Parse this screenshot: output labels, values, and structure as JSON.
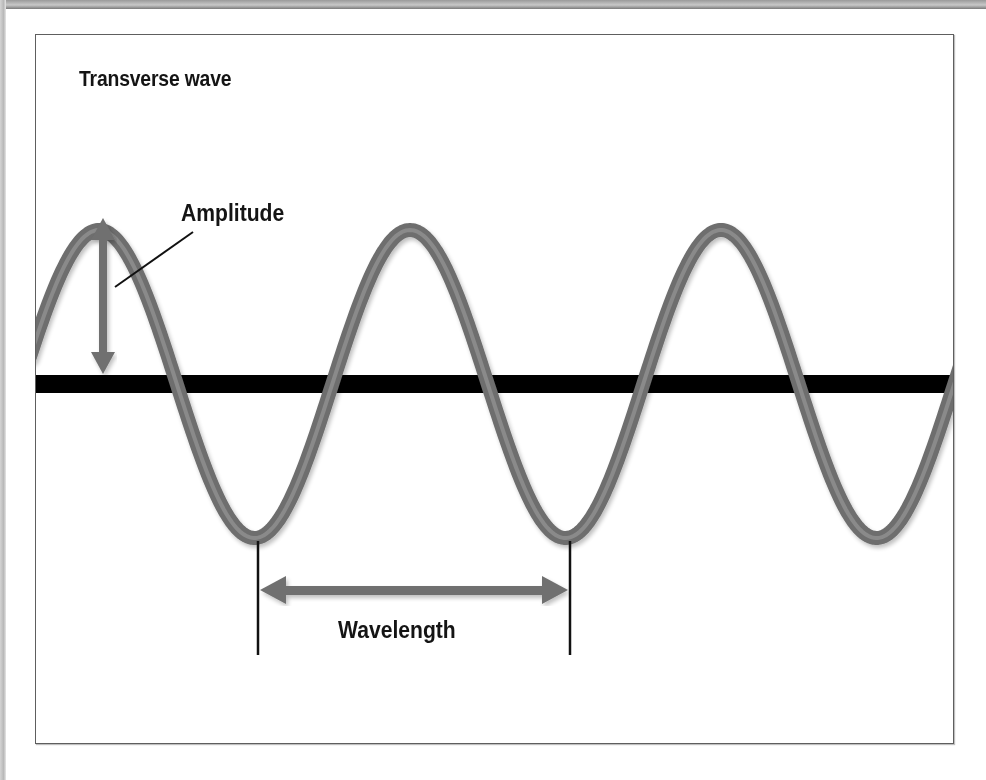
{
  "diagram": {
    "title": "Transverse wave",
    "labels": {
      "amplitude": "Amplitude",
      "wavelength": "Wavelength"
    },
    "colors": {
      "wave": "#6e6e6e",
      "baseline": "#000000",
      "arrow": "#707070",
      "frame_border": "#5e5e5e",
      "text": "#141414"
    },
    "geometry": {
      "baseline_y": 384,
      "amplitude_px": 154,
      "wavelength_px": 311,
      "peaks_x": [
        99,
        410,
        722
      ],
      "troughs_x": [
        258,
        568,
        878
      ]
    }
  }
}
